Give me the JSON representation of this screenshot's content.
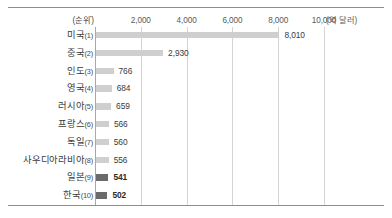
{
  "chart_data": {
    "type": "bar",
    "orientation": "horizontal",
    "title": "",
    "xlabel": "(억 달러)",
    "ylabel": "(순위)",
    "unit_note": "(억 달러)",
    "rank_header": "(순위)",
    "xlim": [
      0,
      10000
    ],
    "xticks": [
      2000,
      4000,
      6000,
      8000,
      10000
    ],
    "xtick_labels": [
      "2,000",
      "4,000",
      "6,000",
      "8,000",
      "10,000"
    ],
    "grid": "vertical",
    "legend": "none",
    "categories": [
      "미국(1)",
      "중국(2)",
      "인도(3)",
      "영국(4)",
      "러시아(5)",
      "프랑스(6)",
      "독일(7)",
      "사우디아라비아(8)",
      "일본(9)",
      "한국(10)"
    ],
    "values": [
      8010,
      2930,
      766,
      684,
      659,
      566,
      560,
      556,
      541,
      502
    ],
    "value_labels": [
      "8,010",
      "2,930",
      "766",
      "684",
      "659",
      "566",
      "560",
      "556",
      "541",
      "502"
    ],
    "rows": [
      {
        "country": "미국",
        "rank": "(1)",
        "value": 8010,
        "value_label": "8,010",
        "highlight": false
      },
      {
        "country": "중국",
        "rank": "(2)",
        "value": 2930,
        "value_label": "2,930",
        "highlight": false
      },
      {
        "country": "인도",
        "rank": "(3)",
        "value": 766,
        "value_label": "766",
        "highlight": false
      },
      {
        "country": "영국",
        "rank": "(4)",
        "value": 684,
        "value_label": "684",
        "highlight": false
      },
      {
        "country": "러시아",
        "rank": "(5)",
        "value": 659,
        "value_label": "659",
        "highlight": false
      },
      {
        "country": "프랑스",
        "rank": "(6)",
        "value": 566,
        "value_label": "566",
        "highlight": false
      },
      {
        "country": "독일",
        "rank": "(7)",
        "value": 560,
        "value_label": "560",
        "highlight": false
      },
      {
        "country": "사우디아라비아",
        "rank": "(8)",
        "value": 556,
        "value_label": "556",
        "highlight": false
      },
      {
        "country": "일본",
        "rank": "(9)",
        "value": 541,
        "value_label": "541",
        "highlight": true
      },
      {
        "country": "한국",
        "rank": "(10)",
        "value": 502,
        "value_label": "502",
        "highlight": true
      }
    ],
    "colors": {
      "bar": "#cfcfcf",
      "bar_highlight": "#6b6b6b",
      "gridline": "#d4d4d4",
      "axis": "#a8a8a8",
      "rule": "#8d8d8d",
      "text": "#3a3a3a",
      "background": "#ffffff"
    }
  }
}
